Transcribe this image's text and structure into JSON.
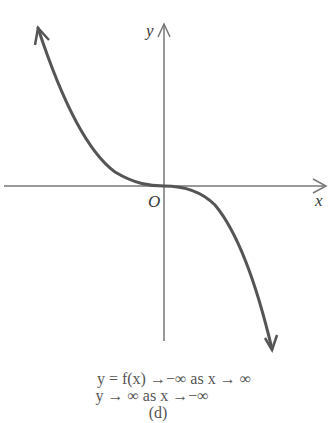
{
  "diagram": {
    "type": "function-graph",
    "axes": {
      "x_label": "x",
      "y_label": "y",
      "origin_label": "O"
    },
    "curve": {
      "description": "decreasing cubic-like curve, flat at origin",
      "color": "#555555"
    },
    "caption": {
      "line1": "y = f(x)  →−∞ as x → ∞",
      "line2": "y → ∞ as x →−∞",
      "panel": "(d)"
    }
  }
}
